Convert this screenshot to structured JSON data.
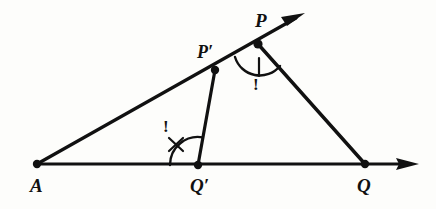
{
  "figure": {
    "type": "geometry-diagram",
    "background_color": "#fdfdfb",
    "ink_color": "#111111",
    "points": [
      {
        "id": "A",
        "label": "A",
        "x": 37,
        "y": 164,
        "label_x": 30,
        "label_y": 176,
        "dot": true
      },
      {
        "id": "Qp",
        "label": "Q′",
        "x": 198,
        "y": 165,
        "label_x": 190,
        "label_y": 176,
        "dot": true
      },
      {
        "id": "Q",
        "label": "Q",
        "x": 365,
        "y": 164,
        "label_x": 357,
        "label_y": 176,
        "dot": true
      },
      {
        "id": "Pp",
        "label": "P′",
        "x": 215,
        "y": 70,
        "label_x": 197,
        "label_y": 43,
        "dot": true
      },
      {
        "id": "P",
        "label": "P",
        "x": 258,
        "y": 44,
        "label_x": 255,
        "label_y": 11,
        "dot": true
      }
    ],
    "segments": [
      {
        "id": "ray-A-P",
        "from": "A",
        "to": "P",
        "arrow_to": {
          "x": 305,
          "y": 13
        },
        "arrow": true
      },
      {
        "id": "ray-A-Q",
        "from": "A",
        "to": "Q",
        "arrow_to": {
          "x": 418,
          "y": 164
        },
        "arrow": true
      },
      {
        "id": "seg-Pp-Qp",
        "from": "Pp",
        "to": "Qp",
        "arrow": false
      },
      {
        "id": "seg-P-Q",
        "from": "P",
        "to": "Q",
        "arrow": false
      }
    ],
    "angle_marks": [
      {
        "id": "angle-at-Qprime",
        "vertex": "Qp",
        "radius": 28,
        "tick": "cross",
        "annotation": "!",
        "annotation_x": 163,
        "annotation_y": 118
      },
      {
        "id": "angle-at-P",
        "vertex": "P",
        "radius": 26,
        "tick": "slash",
        "annotation": "!",
        "annotation_x": 253,
        "annotation_y": 76
      }
    ]
  }
}
